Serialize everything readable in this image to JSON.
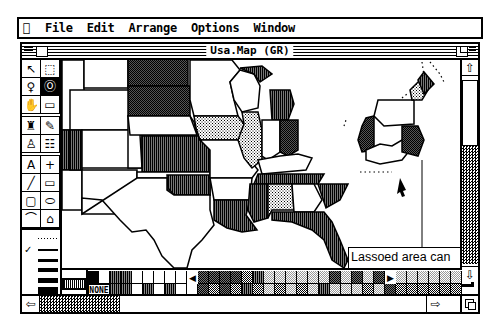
{
  "menubar": {
    "apple": "",
    "items": [
      "File",
      "Edit",
      "Arrange",
      "Options",
      "Window"
    ]
  },
  "window": {
    "title": "Usa.Map (GR)"
  },
  "toolbox": {
    "tools": [
      {
        "name": "arrow-tool",
        "glyph": "↖",
        "selected": false
      },
      {
        "name": "marquee-tool",
        "glyph": "⬚",
        "selected": false
      },
      {
        "name": "lasso-grab-tool",
        "glyph": "♀",
        "selected": false
      },
      {
        "name": "lasso-tool",
        "glyph": "Ⓞ",
        "selected": true
      },
      {
        "name": "hand-tool",
        "glyph": "✋",
        "selected": false
      },
      {
        "name": "eraser-tool",
        "glyph": "▭",
        "selected": false
      },
      {
        "name": "brush-tool",
        "glyph": "♜",
        "selected": false
      },
      {
        "name": "pencil-tool",
        "glyph": "✎",
        "selected": false
      },
      {
        "name": "paint-bucket-tool",
        "glyph": "♙",
        "selected": false
      },
      {
        "name": "spray-can-tool",
        "glyph": "☷",
        "selected": false
      },
      {
        "name": "text-tool",
        "glyph": "A",
        "selected": false
      },
      {
        "name": "crosshair-tool",
        "glyph": "+",
        "selected": false
      },
      {
        "name": "line-tool",
        "glyph": "╱",
        "selected": false
      },
      {
        "name": "rectangle-tool",
        "glyph": "▭",
        "selected": false
      },
      {
        "name": "rounded-rect-tool",
        "glyph": "▢",
        "selected": false
      },
      {
        "name": "oval-tool",
        "glyph": "⬭",
        "selected": false
      },
      {
        "name": "arc-tool",
        "glyph": "⌒",
        "selected": false
      },
      {
        "name": "polygon-tool",
        "glyph": "⌂",
        "selected": false
      }
    ],
    "line_widths": [
      "dotted",
      "1",
      "2",
      "3",
      "4",
      "5"
    ],
    "selected_line_width": "1"
  },
  "callout": {
    "line1": "Lassoed area can",
    "line2": "be dragged away"
  },
  "palette": {
    "none_label": "NONE",
    "current_fill": "vertical-stripe"
  }
}
